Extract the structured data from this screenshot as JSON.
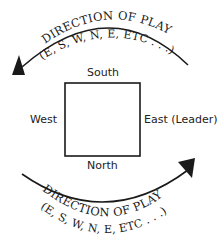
{
  "diagram": {
    "top_arc": {
      "title": "DIRECTION OF PLAY",
      "subtitle": "(E, S, W, N, E, ETC . . .)"
    },
    "bottom_arc": {
      "title": "DIRECTION OF PLAY",
      "subtitle": "(E, S, W, N, E, ETC . . .)"
    },
    "seats": {
      "south": "South",
      "west": "West",
      "east": "East (Leader)",
      "north": "North"
    },
    "colors": {
      "ink": "#1a1a1a",
      "background": "#ffffff"
    }
  }
}
